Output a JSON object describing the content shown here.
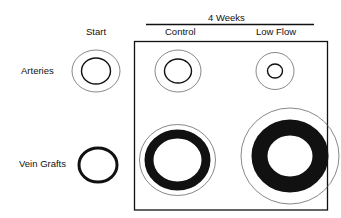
{
  "diagram": {
    "group_header": "4 Weeks",
    "columns": [
      "Start",
      "Control",
      "Low Flow"
    ],
    "rows": [
      "Arteries",
      "Vein Grafts"
    ],
    "colors": {
      "ink": "#111111",
      "thin_line": "#555555",
      "background": "#ffffff"
    },
    "cells": [
      {
        "row": "Arteries",
        "column": "Start",
        "outer_wall": "thin ring",
        "lumen": "medium"
      },
      {
        "row": "Arteries",
        "column": "Control",
        "outer_wall": "thin ring",
        "lumen": "medium"
      },
      {
        "row": "Arteries",
        "column": "Low Flow",
        "outer_wall": "thin ring, smaller",
        "lumen": "small"
      },
      {
        "row": "Vein Grafts",
        "column": "Start",
        "wall": "thin black ring",
        "lumen": "medium"
      },
      {
        "row": "Vein Grafts",
        "column": "Control",
        "wall": "thick black band with thin outer ring",
        "lumen": "medium"
      },
      {
        "row": "Vein Grafts",
        "column": "Low Flow",
        "wall": "very thick black band with large thin outer ring",
        "lumen": "medium"
      }
    ]
  }
}
